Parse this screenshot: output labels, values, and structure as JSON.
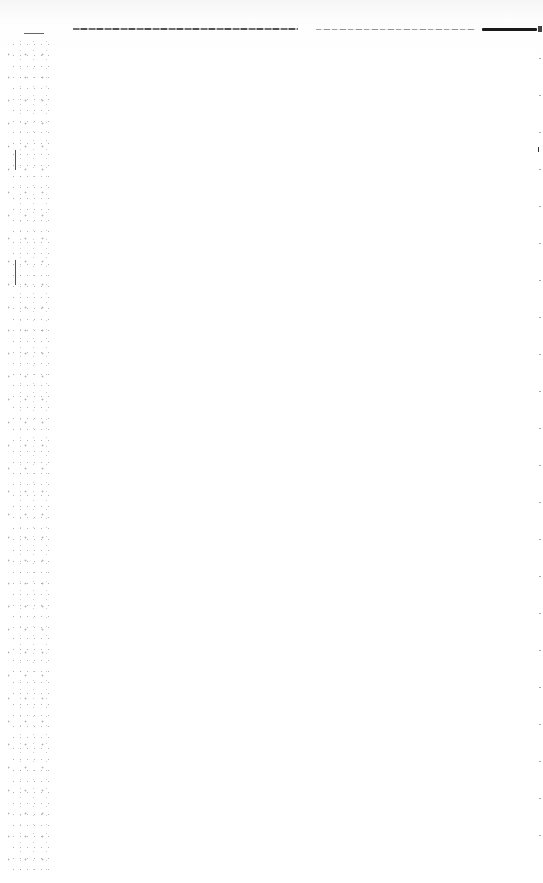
{
  "document": {
    "type": "scanned-page",
    "text_content": [],
    "header_rule": {
      "present": true,
      "color": "#1a1a1a"
    },
    "body_text": ""
  },
  "colors": {
    "paper": "#fefefe",
    "ink": "#1a1a1a",
    "noise": "#555555"
  }
}
